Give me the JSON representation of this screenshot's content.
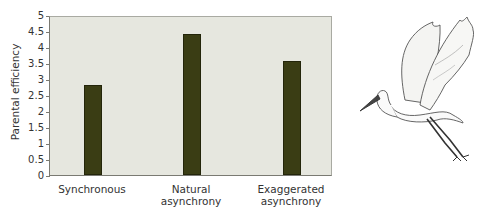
{
  "chart_data": {
    "type": "bar",
    "title": "",
    "xlabel": "",
    "ylabel": "Parental efficiency",
    "ylim": [
      0,
      5
    ],
    "yticks": [
      "0",
      "0.5",
      "1",
      "1.5",
      "2",
      "2.5",
      "3",
      "3.5",
      "4",
      "4.5",
      "5"
    ],
    "categories": [
      "Synchronous",
      "Natural asynchrony",
      "Exaggerated asynchrony"
    ],
    "category_lines": [
      [
        "Synchronous"
      ],
      [
        "Natural",
        "asynchrony"
      ],
      [
        "Exaggerated",
        "asynchrony"
      ]
    ],
    "values": [
      2.8,
      4.4,
      3.55
    ],
    "grid": false,
    "legend": null,
    "bar_color": "#3a3d14",
    "plot_background": "#e6e7df"
  },
  "illustration": {
    "subject": "egret-in-flight"
  }
}
